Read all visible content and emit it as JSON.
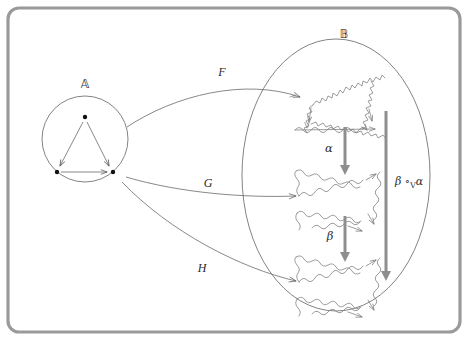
{
  "figure": {
    "width": 468,
    "height": 340,
    "background_color": "#ffffff",
    "frame": {
      "stroke_color": "#9a9a9a",
      "corner_radius": 10
    }
  },
  "source_object": {
    "label": "A⃝",
    "label_text": "𝔸",
    "shape": "circle",
    "cx": 85,
    "cy": 139,
    "r": 43,
    "stroke_color": "#6d6d6d",
    "contents_description": "triangle-shaped category with three objects and three arrows",
    "vertices": [
      {
        "name": "top",
        "x": 85,
        "y": 117
      },
      {
        "name": "bottom-left",
        "x": 57,
        "y": 172
      },
      {
        "name": "bottom-right",
        "x": 113,
        "y": 172
      }
    ]
  },
  "target_object": {
    "label_text": "𝔹",
    "shape": "ellipse",
    "cx": 336,
    "cy": 175,
    "rx": 94,
    "ry": 136,
    "stroke_color": "#6d6d6d",
    "contents_description": "three fractal Koch-style triangle objects stacked vertically"
  },
  "functors": [
    {
      "name": "F",
      "label": "F",
      "label_x": 222,
      "label_y": 76,
      "from": "𝔸",
      "to": "𝔹",
      "target_index": 0
    },
    {
      "name": "G",
      "label": "G",
      "label_x": 208,
      "label_y": 187,
      "from": "𝔸",
      "to": "𝔹",
      "target_index": 1
    },
    {
      "name": "H",
      "label": "H",
      "label_x": 202,
      "label_y": 272,
      "from": "𝔸",
      "to": "𝔹",
      "target_index": 2
    }
  ],
  "natural_transformations": [
    {
      "name": "alpha",
      "label": "α",
      "label_x": 329,
      "label_y": 150,
      "from": "F",
      "to": "G",
      "arrow_x": 345,
      "arrow_y1": 127,
      "arrow_y2": 172
    },
    {
      "name": "beta",
      "label": "β",
      "label_x": 330,
      "label_y": 238,
      "from": "G",
      "to": "H",
      "arrow_x": 345,
      "arrow_y1": 216,
      "arrow_y2": 259
    },
    {
      "name": "beta-circ-v-alpha",
      "label": "β ∘",
      "label_sub": "V",
      "label_tail": "α",
      "label_full": "β ∘ᵥ α",
      "label_x": 392,
      "label_y": 184,
      "from": "F",
      "to": "H",
      "arrow_x": 386,
      "arrow_y1": 111,
      "arrow_y2": 278
    }
  ],
  "fractal_objects": [
    {
      "name": "fractal-triangle-F",
      "cx": 337,
      "cy": 93,
      "size": 52
    },
    {
      "name": "fractal-triangle-G",
      "cx": 339,
      "cy": 194,
      "size": 52
    },
    {
      "name": "fractal-triangle-H",
      "cx": 339,
      "cy": 280,
      "size": 52
    }
  ]
}
